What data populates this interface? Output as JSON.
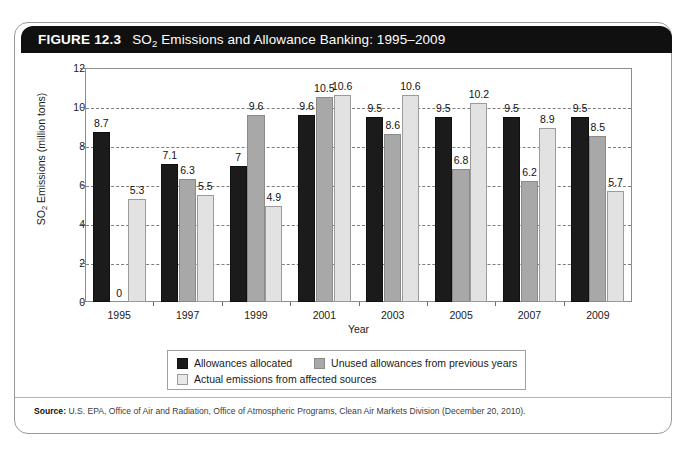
{
  "figure": {
    "number_label": "FIGURE 12.3",
    "title": "SO2 Emissions and Allowance Banking: 1995–2009",
    "title_prefix": "SO",
    "title_subscript": "2",
    "title_suffix": " Emissions and Allowance Banking: 1995–2009"
  },
  "source": {
    "label": "Source:",
    "text": "U.S. EPA, Office of Air and Radiation, Office of Atmospheric Programs, Clean Air Markets Division (December 20, 2010)."
  },
  "axis": {
    "y_title_prefix": "SO",
    "y_title_subscript": "2",
    "y_title_suffix": " Emissions (million tons)",
    "y_title_full": "SO2 Emissions (million tons)",
    "x_title": "Year"
  },
  "legend": {
    "items": [
      {
        "label": "Allowances allocated",
        "color": "#1b1b1b",
        "swatch": "series-0"
      },
      {
        "label": "Unused allowances from previous years",
        "color": "#a8a8a8",
        "swatch": "series-1"
      },
      {
        "label": "Actual emissions from affected sources",
        "color": "#e8e8e8",
        "swatch": "series-2"
      }
    ]
  },
  "colors": {
    "allowances_allocated": "#1b1b1b",
    "unused_allowances": "#a8a8a8",
    "actual_emissions": "#e2e2e2",
    "header_bar": "#101010",
    "frame_border": "#9a9a9a",
    "gridline": "#7d7d7d"
  },
  "chart_data": {
    "type": "bar",
    "title": "SO2 Emissions and Allowance Banking: 1995–2009",
    "xlabel": "Year",
    "ylabel": "SO2 Emissions (million tons)",
    "ylim": [
      0,
      12
    ],
    "yticks": [
      0,
      2,
      4,
      6,
      8,
      10,
      12
    ],
    "ytick_labels": [
      "0",
      "2",
      "4",
      "6",
      "8",
      "10",
      "12"
    ],
    "grid": true,
    "grid_axis": "y",
    "legend_position": "below-plot",
    "categories": [
      "1995",
      "1997",
      "1999",
      "2001",
      "2003",
      "2005",
      "2007",
      "2009"
    ],
    "series": [
      {
        "name": "Allowances allocated",
        "color": "#1b1b1b",
        "values": [
          8.7,
          7.1,
          7,
          9.6,
          9.5,
          9.5,
          9.5,
          9.5
        ],
        "labels": [
          "8.7",
          "7.1",
          "7",
          "9.6",
          "9.5",
          "9.5",
          "9.5",
          "9.5"
        ]
      },
      {
        "name": "Unused allowances from previous years",
        "color": "#a8a8a8",
        "values": [
          0,
          6.3,
          9.6,
          10.5,
          8.6,
          6.8,
          6.2,
          8.5
        ],
        "labels": [
          "0",
          "6.3",
          "9.6",
          "10.5",
          "8.6",
          "6.8",
          "6.2",
          "8.5"
        ]
      },
      {
        "name": "Actual emissions from affected sources",
        "color": "#e2e2e2",
        "values": [
          5.3,
          5.5,
          4.9,
          10.6,
          10.6,
          10.2,
          8.9,
          5.7
        ],
        "labels": [
          "5.3",
          "5.5",
          "4.9",
          "10.6",
          "10.6",
          "10.2",
          "8.9",
          "5.7"
        ]
      }
    ]
  }
}
